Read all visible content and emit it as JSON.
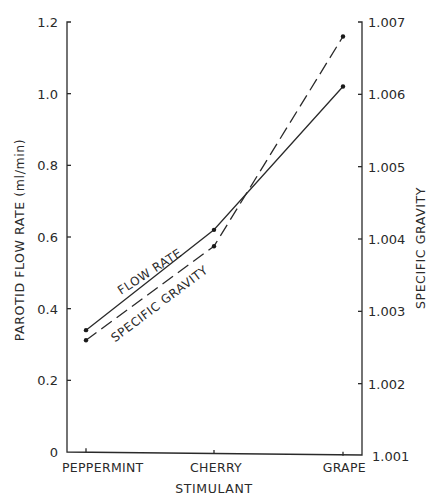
{
  "chart_data": {
    "type": "line",
    "title": "",
    "xlabel": "STIMULANT",
    "ylabel": "PAROTID FLOW RATE (ml/min)",
    "y2label": "SPECIFIC GRAVITY",
    "categories": [
      "PEPPERMINT",
      "CHERRY",
      "GRAPE"
    ],
    "series": [
      {
        "name": "FLOW RATE",
        "axis": "left",
        "style": "solid",
        "values": [
          0.34,
          0.62,
          1.02
        ]
      },
      {
        "name": "SPECIFIC GRAVITY",
        "axis": "right",
        "style": "dashed",
        "values": [
          1.0026,
          1.0039,
          1.0068
        ]
      }
    ],
    "ylim": [
      0,
      1.2
    ],
    "y_ticks": [
      "0",
      "0.2",
      "0.4",
      "0.6",
      "0.8",
      "1.0",
      "1.2"
    ],
    "y2lim": [
      1.001,
      1.007
    ],
    "y2_ticks": [
      "1.001",
      "1.002",
      "1.003",
      "1.004",
      "1.005",
      "1.006",
      "1.007"
    ],
    "grid": false,
    "legend": "inline labels along lines"
  }
}
